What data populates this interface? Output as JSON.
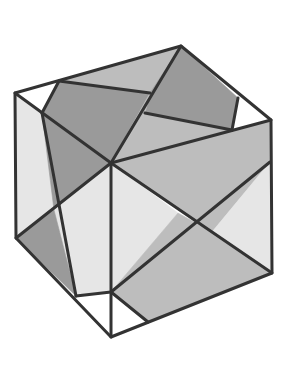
{
  "figure": {
    "colors": {
      "background": "#ffffff",
      "stroke": "#333333",
      "white": "#ffffff",
      "light": "#e6e6e6",
      "mid": "#bdbdbd",
      "dark": "#9a9a9a"
    },
    "stroke_width": 3,
    "regions": [
      {
        "name": "top-face-left-white-triangle",
        "fill": "white",
        "points": "15,93 59,81 42,113"
      },
      {
        "name": "top-face-dark-quad-left",
        "fill": "dark",
        "points": "59,81 150,93 111,163 42,113"
      },
      {
        "name": "top-face-mid-strip",
        "fill": "mid",
        "points": "59,81 181,46 150,93"
      },
      {
        "name": "top-face-dark-quad-right",
        "fill": "dark",
        "points": "181,46 238,98 232,130 145,113 150,93"
      },
      {
        "name": "top-face-mid-center",
        "fill": "mid",
        "points": "150,93 145,113 111,163"
      },
      {
        "name": "top-face-mid-lower",
        "fill": "mid",
        "points": "145,113 232,130 111,163"
      },
      {
        "name": "top-face-right-white-triangle",
        "fill": "white",
        "points": "238,98 271,120 232,130"
      },
      {
        "name": "left-face-top-light",
        "fill": "light",
        "points": "15,93 42,113 54,210 16,238"
      },
      {
        "name": "left-face-dark-wedge",
        "fill": "dark",
        "points": "42,113 111,163 54,210"
      },
      {
        "name": "left-face-light-center",
        "fill": "light",
        "points": "54,210 111,163 111,292 76,296"
      },
      {
        "name": "left-face-dark-bottom",
        "fill": "dark",
        "points": "16,238 54,210 76,296"
      },
      {
        "name": "left-face-white-bottom",
        "fill": "white",
        "points": "76,296 111,292 111,337"
      },
      {
        "name": "right-face-mid-top",
        "fill": "mid",
        "points": "111,163 232,130 271,120 270,162 212,232"
      },
      {
        "name": "right-face-light-center-left",
        "fill": "light",
        "points": "111,163 178,213 111,292"
      },
      {
        "name": "right-face-light-right",
        "fill": "light",
        "points": "270,162 272,273 212,232"
      },
      {
        "name": "right-face-mid-bottom",
        "fill": "mid",
        "points": "111,292 178,213 212,232 272,273 148,322"
      },
      {
        "name": "right-face-white-bottom",
        "fill": "white",
        "points": "111,292 148,322 111,337"
      }
    ],
    "lines": [
      {
        "name": "outline",
        "points": "15,93 181,46 271,120 272,273 111,337 16,238 15,93",
        "closed": true
      },
      {
        "name": "edge-top-left",
        "points": "15,93 111,163"
      },
      {
        "name": "edge-top-right",
        "points": "111,163 271,120"
      },
      {
        "name": "edge-vertical",
        "points": "111,163 111,337"
      },
      {
        "name": "top-line-1",
        "points": "59,81 42,113"
      },
      {
        "name": "top-line-2",
        "points": "59,81 150,93"
      },
      {
        "name": "top-line-3",
        "points": "181,46 111,163"
      },
      {
        "name": "top-line-4",
        "points": "145,113 232,130"
      },
      {
        "name": "top-line-5",
        "points": "238,98 232,130"
      },
      {
        "name": "left-line-1",
        "points": "16,238 111,163"
      },
      {
        "name": "left-line-2",
        "points": "42,113 76,296"
      },
      {
        "name": "left-line-3",
        "points": "76,296 111,292"
      },
      {
        "name": "right-line-1",
        "points": "111,163 272,273"
      },
      {
        "name": "right-line-2",
        "points": "270,162 111,292"
      },
      {
        "name": "right-line-3",
        "points": "111,292 148,322"
      }
    ]
  }
}
